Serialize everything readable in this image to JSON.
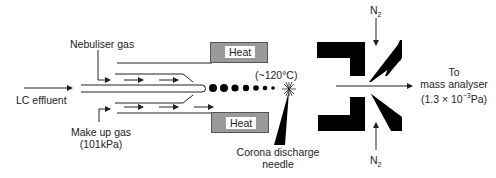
{
  "diagram": {
    "type": "APCI ion source schematic",
    "labels": {
      "nebuliser_gas": "Nebuliser gas",
      "lc_effluent": "LC effluent",
      "make_up_gas": "Make up gas",
      "make_up_gas_pressure": "(101kPa)",
      "heat_top": "Heat",
      "heat_bottom": "Heat",
      "temperature": "(~120°C)",
      "corona_line1": "Corona discharge",
      "corona_line2": "needle",
      "n2_top": "N",
      "n2_top_sub": "2",
      "n2_bottom": "N",
      "n2_bottom_sub": "2",
      "to": "To",
      "mass_analyser": "mass analyser",
      "analyser_pressure_prefix": "(1.3 × 10",
      "analyser_pressure_exp": "−3",
      "analyser_pressure_suffix": "Pa)"
    },
    "colors": {
      "line": "#222222",
      "heater_fill": "#9a9a9a",
      "block_fill": "#000000",
      "background": "#ffffff"
    },
    "droplet_count": 7
  }
}
